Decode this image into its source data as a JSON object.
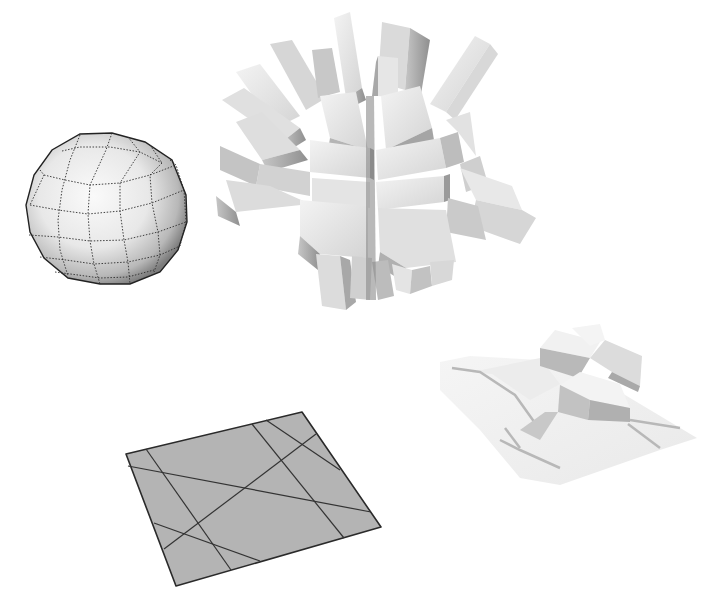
{
  "figure": {
    "background": "#ffffff",
    "objects": [
      {
        "id": "faceted-sphere",
        "description": "Low-poly sphere with dotted quad wireframe",
        "bounds": {
          "x": 26,
          "y": 133,
          "w": 162,
          "h": 152
        },
        "fill_light": "#f4f4f4",
        "fill_dark": "#8a8a8a",
        "wire_color": "#333333"
      },
      {
        "id": "extruded-block-cluster",
        "description": "Radial burst of extruded rectangular prisms",
        "bounds": {
          "x": 215,
          "y": 12,
          "w": 322,
          "h": 300
        },
        "fill_light": "#eeeeee",
        "fill_dark": "#9a9a9a"
      },
      {
        "id": "subdivided-plane",
        "description": "Gray plane in perspective cut by straight lines",
        "corners": [
          [
            126,
            454
          ],
          [
            302,
            412
          ],
          [
            381,
            527
          ],
          [
            176,
            586
          ]
        ],
        "fill": "#b3b3b3",
        "line_color": "#2e2e2e"
      },
      {
        "id": "extruded-terrain",
        "description": "Plane with regions extruded to varying heights",
        "bounds": {
          "x": 440,
          "y": 325,
          "w": 257,
          "h": 160
        },
        "fill_light": "#f2f2f2",
        "fill_dark": "#b5b5b5"
      }
    ]
  }
}
